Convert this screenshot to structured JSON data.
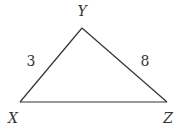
{
  "diagram": {
    "type": "triangle",
    "vertices": [
      {
        "name": "X",
        "x": 20,
        "y": 102,
        "label_x": 13,
        "label_y": 123
      },
      {
        "name": "Y",
        "x": 82,
        "y": 28,
        "label_x": 82,
        "label_y": 16
      },
      {
        "name": "Z",
        "x": 167,
        "y": 102,
        "label_x": 168,
        "label_y": 123
      }
    ],
    "sides": [
      {
        "from": "X",
        "to": "Y",
        "label": "3",
        "label_x": 31,
        "label_y": 66
      },
      {
        "from": "Y",
        "to": "Z",
        "label": "8",
        "label_x": 145,
        "label_y": 66
      },
      {
        "from": "X",
        "to": "Z",
        "label": ""
      }
    ],
    "colors": {
      "stroke": "#333333",
      "text": "#333333",
      "background": "#ffffff"
    }
  }
}
